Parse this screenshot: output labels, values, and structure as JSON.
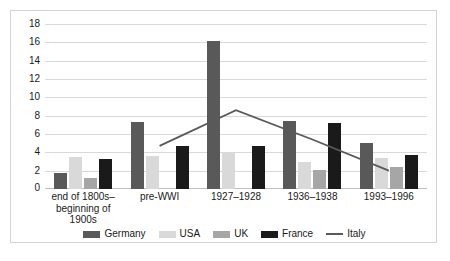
{
  "chart_data": {
    "type": "bar",
    "title": "",
    "xlabel": "",
    "ylabel": "",
    "ylim": [
      0,
      18
    ],
    "ytick_step": 2,
    "yticks": [
      18,
      16,
      14,
      12,
      10,
      8,
      6,
      4,
      2,
      0
    ],
    "grid": true,
    "legend_position": "bottom",
    "categories": [
      "end of 1800s–\nbeginning of 1900s",
      "pre-WWI",
      "1927–1928",
      "1936–1938",
      "1993–1996"
    ],
    "series": [
      {
        "name": "Germany",
        "type": "bar",
        "color": "#595959",
        "values": [
          1.8,
          7.3,
          16.1,
          7.4,
          5.0
        ]
      },
      {
        "name": "USA",
        "type": "bar",
        "color": "#d9d9d9",
        "values": [
          3.5,
          3.6,
          4.0,
          3.0,
          3.4
        ]
      },
      {
        "name": "UK",
        "type": "bar",
        "color": "#a6a6a6",
        "values": [
          1.2,
          null,
          null,
          2.1,
          2.4
        ]
      },
      {
        "name": "France",
        "type": "bar",
        "color": "#1a1a1a",
        "values": [
          3.3,
          4.7,
          4.7,
          7.2,
          3.7
        ]
      },
      {
        "name": "Italy",
        "type": "line",
        "color": "#595959",
        "values": [
          null,
          4.7,
          8.6,
          5.4,
          2.0
        ]
      }
    ]
  },
  "yticks": {
    "t0": "18",
    "t1": "16",
    "t2": "14",
    "t3": "12",
    "t4": "10",
    "t5": "8",
    "t6": "6",
    "t7": "4",
    "t8": "2",
    "t9": "0"
  },
  "xlabels": {
    "c0_line1": "end of 1800s–",
    "c0_line2": "beginning of 1900s",
    "c1": "pre-WWI",
    "c2": "1927–1928",
    "c3": "1936–1938",
    "c4": "1993–1996"
  },
  "legend": {
    "germany": "Germany",
    "usa": "USA",
    "uk": "UK",
    "france": "France",
    "italy": "Italy"
  },
  "colors": {
    "germany": "#595959",
    "usa": "#d9d9d9",
    "uk": "#a6a6a6",
    "france": "#1a1a1a",
    "italy": "#595959",
    "gridline": "#d9d9d9",
    "border": "#d4d4d4"
  }
}
